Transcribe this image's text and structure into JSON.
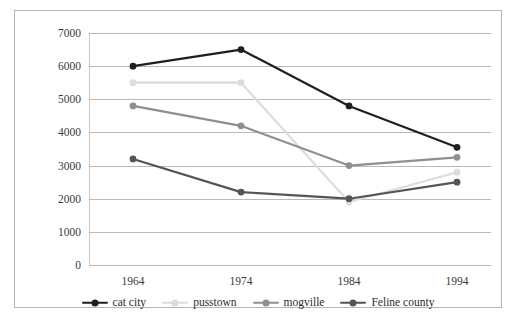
{
  "chart_data": {
    "type": "line",
    "title": "",
    "subtitle": "",
    "xlabel": "",
    "ylabel": "",
    "categories": [
      "1964",
      "1974",
      "1984",
      "1994"
    ],
    "ylim": [
      0,
      7000
    ],
    "ytick_labels": [
      "0",
      "1000",
      "2000",
      "3000",
      "4000",
      "5000",
      "6000",
      "7000"
    ],
    "ytick_values": [
      0,
      1000,
      2000,
      3000,
      4000,
      5000,
      6000,
      7000
    ],
    "grid": "horizontal",
    "legend_position": "bottom",
    "series": [
      {
        "name": "cat city",
        "color": "#1f1f1f",
        "values": [
          6000,
          6500,
          4800,
          3550
        ]
      },
      {
        "name": "pusstown",
        "color": "#dcdcdc",
        "values": [
          5500,
          5500,
          1900,
          2800
        ]
      },
      {
        "name": "mogville",
        "color": "#8f8f8f",
        "values": [
          4800,
          4200,
          3000,
          3250
        ]
      },
      {
        "name": "Feline county",
        "color": "#555555",
        "values": [
          3200,
          2200,
          2000,
          2500
        ]
      }
    ]
  },
  "style": {
    "frame_border_color": "#b5b5b5",
    "gridline_color": "#b9b9b9",
    "background": "#ffffff",
    "tick_label_color": "#3a3a3a"
  }
}
